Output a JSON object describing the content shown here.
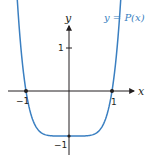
{
  "chart_data": {
    "type": "line",
    "title": "",
    "xlabel": "x",
    "ylabel": "y",
    "series": [
      {
        "name": "y = P(x)",
        "color": "#3a7fc1",
        "x": [
          -1.25,
          -1.2,
          -1.1,
          -1.0,
          -0.9,
          -0.8,
          -0.6,
          -0.4,
          -0.2,
          0,
          0.2,
          0.4,
          0.6,
          0.8,
          0.9,
          1.0,
          1.1,
          1.2,
          1.25
        ],
        "y": [
          1.44,
          1.07,
          0.46,
          0,
          -0.34,
          -0.59,
          -0.87,
          -0.97,
          -1.0,
          -1,
          -1.0,
          -0.97,
          -0.87,
          -0.59,
          -0.34,
          0,
          0.46,
          1.07,
          1.44
        ]
      }
    ],
    "x_ticks": [
      "-1",
      "1"
    ],
    "y_ticks": [
      "1",
      "-1"
    ],
    "marked_points": [
      [
        -1,
        0
      ],
      [
        1,
        0
      ],
      [
        0,
        -1
      ]
    ],
    "xlim": [
      -1.6,
      1.6
    ],
    "ylim": [
      -1.4,
      1.8
    ],
    "grid": false,
    "legend": "none"
  },
  "labels": {
    "x_axis": "x",
    "y_axis": "y",
    "curve": "y = P(x)",
    "x_tick_neg1": "−1",
    "x_tick_pos1": "1",
    "y_tick_pos1": "1",
    "y_tick_neg1": "−1"
  },
  "colors": {
    "curve": "#3a7fc1",
    "axis": "#231f20"
  }
}
